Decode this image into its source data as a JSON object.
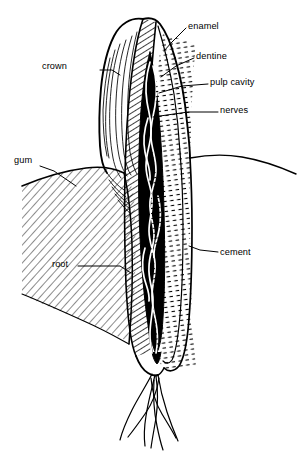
{
  "figure": {
    "style": "black-and-white line drawing",
    "width": 298,
    "height": 455,
    "ink_color": "#000000",
    "background_color": "#ffffff"
  },
  "labels": [
    {
      "id": "crown",
      "text": "crown",
      "side": "left",
      "x": 68,
      "y": 66,
      "anchor": "end",
      "leader": [
        [
          100,
          70
        ],
        [
          112,
          70
        ],
        [
          120,
          74
        ]
      ]
    },
    {
      "id": "gum",
      "text": "gum",
      "side": "left",
      "x": 14,
      "y": 160,
      "anchor": "start",
      "leader": [
        [
          40,
          166
        ],
        [
          52,
          170
        ],
        [
          74,
          185
        ]
      ]
    },
    {
      "id": "root",
      "text": "root",
      "side": "left",
      "x": 52,
      "y": 264,
      "anchor": "start",
      "leader": [
        [
          78,
          266
        ],
        [
          118,
          266
        ],
        [
          130,
          272
        ]
      ]
    },
    {
      "id": "enamel",
      "text": "enamel",
      "side": "right",
      "x": 188,
      "y": 26,
      "anchor": "start",
      "leader": [
        [
          185,
          28
        ],
        [
          172,
          42
        ],
        [
          164,
          50
        ]
      ]
    },
    {
      "id": "dentine",
      "text": "dentine",
      "side": "right",
      "x": 196,
      "y": 56,
      "anchor": "start",
      "leader": [
        [
          193,
          58
        ],
        [
          175,
          66
        ],
        [
          160,
          76
        ]
      ]
    },
    {
      "id": "pulp cavity",
      "text": "pulp cavity",
      "side": "right",
      "x": 210,
      "y": 82,
      "anchor": "start",
      "leader": [
        [
          207,
          84
        ],
        [
          180,
          86
        ],
        [
          158,
          92
        ]
      ]
    },
    {
      "id": "nerves",
      "text": "nerves",
      "side": "right",
      "x": 220,
      "y": 110,
      "anchor": "start",
      "leader": [
        [
          217,
          112
        ],
        [
          186,
          112
        ],
        [
          152,
          116
        ]
      ]
    },
    {
      "id": "cement",
      "text": "cement",
      "side": "right",
      "x": 220,
      "y": 253,
      "anchor": "start",
      "leader": [
        [
          217,
          252
        ],
        [
          200,
          250
        ],
        [
          190,
          247
        ]
      ]
    }
  ],
  "structures": [
    {
      "id": "crown",
      "label": "crown",
      "description": "enamel-covered upper portion of the tooth above the gum line"
    },
    {
      "id": "enamel",
      "label": "enamel",
      "description": "hard outer layer capping the crown, shown as a diagonally hatched band"
    },
    {
      "id": "dentine",
      "label": "dentine",
      "description": "bulk tissue beneath the enamel, drawn with fine tubule dashes"
    },
    {
      "id": "pulp-cavity",
      "label": "pulp cavity",
      "description": "dark central chamber running the length of the tooth"
    },
    {
      "id": "nerves",
      "label": "nerves",
      "description": "pale intertwined strands of nerves and vessels inside the pulp cavity"
    },
    {
      "id": "gum",
      "label": "gum",
      "description": "soft gingival tissue wedge meeting the tooth at the neck, hatched"
    },
    {
      "id": "root",
      "label": "root",
      "description": "lower part of the tooth embedded in the jaw, tapering to the apex"
    },
    {
      "id": "cement",
      "label": "cement",
      "description": "thin layer covering the root surface"
    }
  ]
}
